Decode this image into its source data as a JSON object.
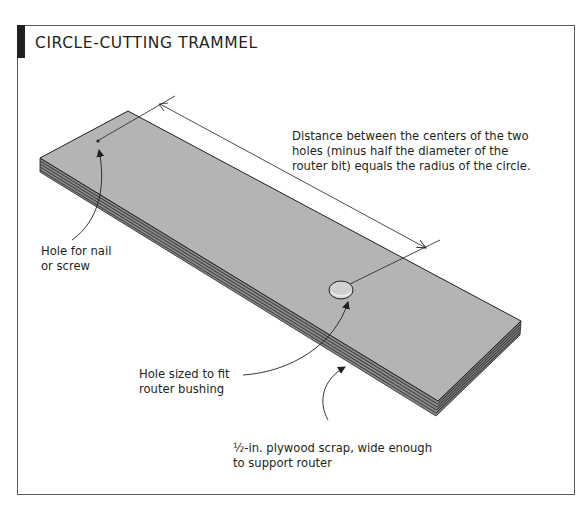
{
  "figure": {
    "title": "CIRCLE-CUTTING TRAMMEL",
    "colors": {
      "board_top": "#b4b4b4",
      "board_edge": "#8a8a8a",
      "lines": "#231f20",
      "frame": "#5a5a5a",
      "title_tab": "#231f20"
    },
    "callouts": {
      "distance": {
        "lines": [
          "Distance between the centers of the two",
          "holes (minus half the diameter of the",
          "router bit) equals the radius of the circle."
        ]
      },
      "nail_hole": {
        "lines": [
          "Hole for nail",
          "or screw"
        ]
      },
      "router_hole": {
        "lines": [
          "Hole sized to fit",
          "router bushing"
        ]
      },
      "plywood": {
        "lines": [
          "½-in. plywood scrap, wide enough",
          "to support router"
        ]
      }
    }
  }
}
